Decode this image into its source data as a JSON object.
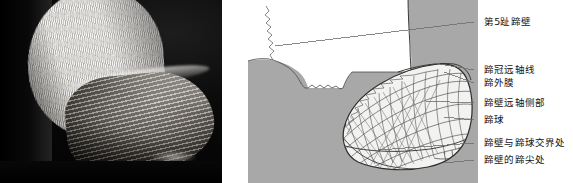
{
  "figure": {
    "panels": [
      {
        "id": "photo",
        "kind": "photograph",
        "caption": "",
        "description": "black and white photograph of a bovine hoof"
      },
      {
        "id": "diagram",
        "kind": "line-drawing",
        "caption": "",
        "description": "labelled line drawing of a bovine hoof"
      }
    ]
  },
  "labels": [
    {
      "id": "l1",
      "text": "第5趾蹄壁",
      "x": 484,
      "y": 16,
      "leader_x": 474,
      "leader_y": 22
    },
    {
      "id": "l2",
      "text": "蹄冠远轴线",
      "x": 484,
      "y": 64,
      "leader_x": 474,
      "leader_y": 70
    },
    {
      "id": "l3",
      "text": "蹄外膜",
      "x": 484,
      "y": 77,
      "leader_x": 474,
      "leader_y": 83
    },
    {
      "id": "l4",
      "text": "蹄壁远轴侧部",
      "x": 484,
      "y": 97,
      "leader_x": 474,
      "leader_y": 103
    },
    {
      "id": "l5",
      "text": "蹄球",
      "x": 484,
      "y": 114,
      "leader_x": 474,
      "leader_y": 120
    },
    {
      "id": "l6",
      "text": "蹄壁与蹄球交界处",
      "x": 484,
      "y": 137,
      "leader_x": 474,
      "leader_y": 143
    },
    {
      "id": "l7",
      "text": "蹄壁的蹄尖处",
      "x": 484,
      "y": 154,
      "leader_x": 474,
      "leader_y": 160
    }
  ],
  "colors": {
    "background": "#ffffff",
    "diagram_fill": "#a8a8a8",
    "hoof_fill": "#f2f2f0",
    "line": "#3a3a3a",
    "leader": "#6b6b6b",
    "text": "#141414",
    "photo_black": "#060606",
    "photo_fur": "#efedea"
  }
}
